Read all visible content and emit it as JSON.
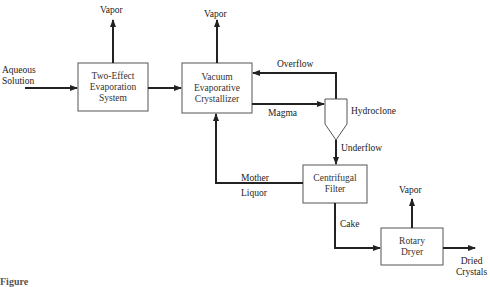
{
  "diagram": {
    "type": "process-flowsheet",
    "inputs": {
      "feed": [
        "Aqueous",
        "Solution"
      ]
    },
    "units": {
      "evaporator": [
        "Two-Effect",
        "Evaporation",
        "System"
      ],
      "crystallizer": [
        "Vacuum",
        "Evaporative",
        "Crystallizer"
      ],
      "hydroclone": "Hydroclone",
      "filter": [
        "Centrifugal",
        "Filter"
      ],
      "dryer": [
        "Rotary",
        "Dryer"
      ]
    },
    "streams": {
      "vapor1": "Vapor",
      "vapor2": "Vapor",
      "vapor3": "Vapor",
      "overflow": "Overflow",
      "magma": "Magma",
      "underflow": "Underflow",
      "mother_liquor": [
        "Mother",
        "Liquor"
      ],
      "cake": "Cake",
      "product": [
        "Dried",
        "Crystals"
      ]
    },
    "caption": "Figure"
  }
}
